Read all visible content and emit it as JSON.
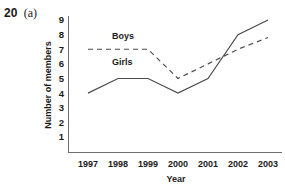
{
  "question": {
    "number": "20",
    "part": "(a)"
  },
  "chart_data": {
    "type": "line",
    "title": "",
    "xlabel": "Year",
    "ylabel": "Number of members",
    "categories": [
      "1997",
      "1998",
      "1999",
      "2000",
      "2001",
      "2002",
      "2003"
    ],
    "yticks": [
      "9",
      "8",
      "7",
      "6",
      "5",
      "4",
      "3",
      "2",
      "1"
    ],
    "ylim": [
      0,
      9
    ],
    "grid": false,
    "legend_position": "inline-labels",
    "series": [
      {
        "name": "Boys",
        "style": "dashed",
        "color": "#4a4a4a",
        "values": [
          7,
          7,
          7,
          5,
          6,
          7,
          7.8
        ]
      },
      {
        "name": "Girls",
        "style": "solid",
        "color": "#4a4a4a",
        "values": [
          4,
          5,
          5,
          4,
          5,
          8,
          9
        ]
      }
    ],
    "annotations": [
      {
        "text": "Boys",
        "x": "1998",
        "y": 7.7
      },
      {
        "text": "Girls",
        "x": "1998",
        "y": 5.9
      }
    ]
  }
}
